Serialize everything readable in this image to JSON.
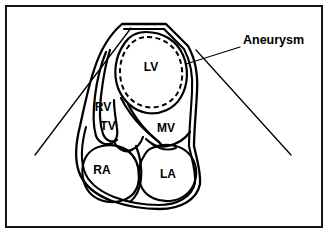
{
  "figure": {
    "frame": {
      "border_color": "#141414",
      "background_color": "#ffffff"
    },
    "callouts": [
      {
        "id": "aneurysm",
        "label": "Aneurysm",
        "x": 243,
        "y": 41
      }
    ],
    "chamber_labels": [
      {
        "id": "lv",
        "label": "LV",
        "x": 151,
        "y": 68,
        "font_size": 12
      },
      {
        "id": "rv",
        "label": "RV",
        "x": 103,
        "y": 108,
        "font_size": 12
      },
      {
        "id": "tv",
        "label": "TV",
        "x": 108,
        "y": 127,
        "font_size": 12
      },
      {
        "id": "mv",
        "label": "MV",
        "x": 166,
        "y": 129,
        "font_size": 12
      },
      {
        "id": "ra",
        "label": "RA",
        "x": 102,
        "y": 171,
        "font_size": 12
      },
      {
        "id": "la",
        "label": "LA",
        "x": 168,
        "y": 175,
        "font_size": 12
      }
    ],
    "stroke_color": "#000000"
  }
}
